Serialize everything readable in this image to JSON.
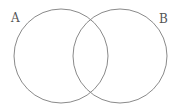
{
  "diagram": {
    "type": "venn",
    "sets": [
      {
        "id": "A",
        "label": "A",
        "cx": 61,
        "cy": 56,
        "r": 47
      },
      {
        "id": "B",
        "label": "B",
        "cx": 120,
        "cy": 56,
        "r": 47
      }
    ],
    "stroke_color": "#8a8a8a",
    "background": "#ffffff"
  }
}
